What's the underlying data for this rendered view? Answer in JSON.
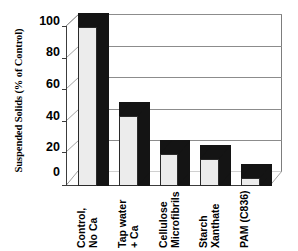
{
  "chart_data": {
    "type": "bar",
    "title": "",
    "subtitle": "",
    "xlabel": "",
    "ylabel": "Suspended Solids (% of Control)",
    "categories": [
      "Control,\nNo Ca",
      "Tap water\n+ Ca",
      "Cellulose\nMicrofibrils",
      "Starch\nXanthate",
      "PAM (C836)"
    ],
    "category_lines": [
      [
        "Control,",
        "No Ca"
      ],
      [
        "Tap water",
        "+ Ca"
      ],
      [
        "Cellulose",
        "Microfibrils"
      ],
      [
        "Starch",
        "Xanthate"
      ],
      [
        "PAM (C836)"
      ]
    ],
    "values": [
      100,
      44,
      20,
      17,
      5
    ],
    "ylim": [
      0,
      100
    ],
    "yticks": [
      100,
      80,
      60,
      40,
      20,
      0
    ],
    "ytick_labels": [
      "100",
      "80",
      "60",
      "40",
      "20",
      "0"
    ],
    "grid": true,
    "grid_axis": "y",
    "legend": false,
    "legend_position": "none",
    "style": "3d-column",
    "colors": {
      "bar_front": "#ececec",
      "bar_shadow": "#141414",
      "bar_outline": "#2a2a2a",
      "gridline": "#8c8c8c",
      "axis": "#3c3c3c",
      "background": "#ffffff",
      "text": "#000000"
    }
  }
}
